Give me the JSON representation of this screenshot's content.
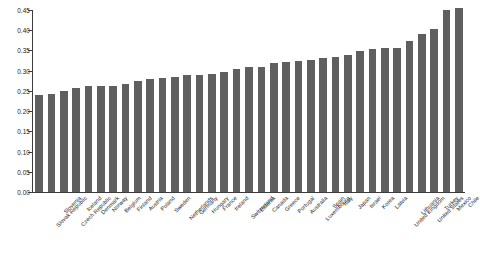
{
  "chart_data": {
    "type": "bar",
    "title": "",
    "subtitle": "",
    "xlabel": "",
    "ylabel": "",
    "ylim": [
      0.0,
      0.45
    ],
    "grid": false,
    "legend": null,
    "bar_color": "#5f5f5f",
    "axis_color": "#3c3c3c",
    "ytick_labels": [
      "0.45",
      "0.40",
      "0.35",
      "0.30",
      "0.25",
      "0.20",
      "0.15",
      "0.10",
      "0.05",
      "0.00"
    ],
    "ytick_values": [
      0.45,
      0.4,
      0.35,
      0.3,
      0.25,
      0.2,
      0.15,
      0.1,
      0.05,
      0.0
    ],
    "categories": [
      "Slovak Republic",
      "Slovenia",
      "Czech Republic",
      "Iceland",
      "Denmark",
      "Norway",
      "Belgium",
      "Finland",
      "Austria",
      "Poland",
      "Sweden",
      "Netherlands",
      "Germany",
      "Hungary",
      "France",
      "Ireland",
      "Switzerland",
      "Estonia",
      "Canada",
      "Greece",
      "Portugal",
      "Australia",
      "Luxembourg",
      "Spain",
      "Italy",
      "Japan",
      "Israel",
      "Korea",
      "Latvia",
      "United Kingdom",
      "Lithuania",
      "United States",
      "Turkey",
      "Mexico",
      "Chile"
    ],
    "values": [
      0.241,
      0.243,
      0.249,
      0.257,
      0.261,
      0.261,
      0.262,
      0.266,
      0.275,
      0.279,
      0.282,
      0.285,
      0.289,
      0.289,
      0.292,
      0.297,
      0.303,
      0.309,
      0.31,
      0.319,
      0.321,
      0.325,
      0.327,
      0.331,
      0.333,
      0.339,
      0.349,
      0.354,
      0.355,
      0.357,
      0.374,
      0.39,
      0.404,
      0.449,
      0.454
    ]
  }
}
